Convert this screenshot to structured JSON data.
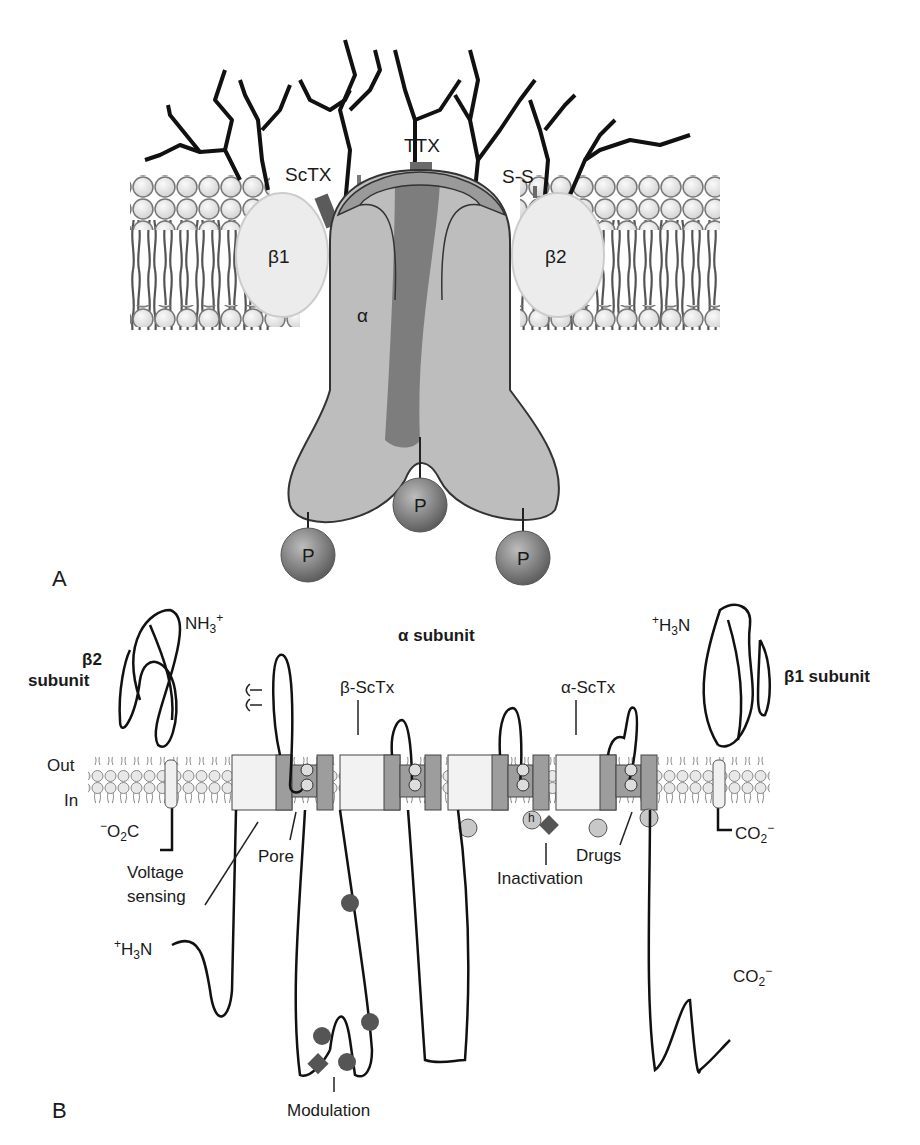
{
  "figure": {
    "panels": {
      "a": {
        "letter": "A",
        "labels": {
          "sctx": "ScTX",
          "ttx": "TTX",
          "ss": "S-S",
          "beta1": "β1",
          "beta2": "β2",
          "alpha": "α",
          "phospho": "P"
        },
        "phospho_sites": 3
      },
      "b": {
        "letter": "B",
        "title": "α subunit",
        "beta2_title_1": "β2",
        "beta2_title_2": "subunit",
        "beta1_title": "β1 subunit",
        "nh3_left": "NH",
        "nh3_left_sub": "3",
        "nh3_left_sup": "+",
        "h3n_right_sup": "+",
        "h3n_right": "H",
        "h3n_right_sub": "3",
        "h3n_right_tail": "N",
        "o2c_left_sup": "−",
        "o2c_left": "O",
        "o2c_left_sub": "2",
        "o2c_left_tail": "C",
        "co2_right": "CO",
        "co2_right_sub": "2",
        "co2_right_sup": "−",
        "out": "Out",
        "in": "In",
        "beta_sctx": "β-ScTx",
        "alpha_sctx": "α-ScTx",
        "voltage_sensing_1": "Voltage",
        "voltage_sensing_2": "sensing",
        "pore": "Pore",
        "inactivation": "Inactivation",
        "drugs": "Drugs",
        "modulation": "Modulation",
        "h3n_bottom_sup": "+",
        "h3n_bottom": "H",
        "h3n_bottom_sub": "3",
        "h3n_bottom_tail": "N",
        "co2_bottom": "CO",
        "co2_bottom_sub": "2",
        "co2_bottom_sup": "−",
        "segments": [
          "1",
          "2",
          "3",
          "4",
          "5",
          "6"
        ],
        "domains": 4,
        "h_gate": "h",
        "phospho": "P"
      }
    },
    "colors": {
      "lipid_head": "#e6e6e6",
      "alpha_light": "#bdbdbd",
      "alpha_mid": "#9a9a9a",
      "alpha_dark": "#7a7a7a",
      "beta": "#ececec",
      "ink": "#1a1a1a",
      "phospho": "#6b6b6b"
    }
  }
}
